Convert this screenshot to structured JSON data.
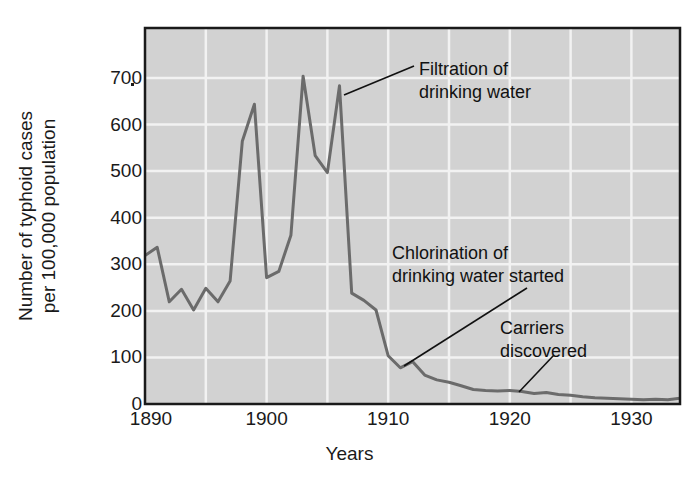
{
  "chart_data": {
    "type": "line",
    "title": "",
    "xlabel": "Years",
    "ylabel_line1": "Number of typhoid cases",
    "ylabel_line2": "per 100,000 population",
    "xlim": [
      1890,
      1934
    ],
    "ylim": [
      0,
      780
    ],
    "xticks": [
      1890,
      1900,
      1910,
      1920,
      1930
    ],
    "yticks": [
      0,
      100,
      200,
      300,
      400,
      500,
      600,
      700
    ],
    "grid": true,
    "legend": null,
    "series_name": "Typhoid fever case rate",
    "line_color": "#6b6b6b",
    "plot_background": "#d2d2d2",
    "gridline_color": "#f2f2f2",
    "x": [
      1890,
      1891,
      1892,
      1893,
      1894,
      1895,
      1896,
      1897,
      1898,
      1899,
      1900,
      1901,
      1902,
      1903,
      1904,
      1905,
      1906,
      1907,
      1908,
      1909,
      1910,
      1911,
      1912,
      1913,
      1914,
      1915,
      1916,
      1917,
      1918,
      1919,
      1920,
      1921,
      1922,
      1923,
      1924,
      1925,
      1926,
      1927,
      1928,
      1929,
      1930,
      1931,
      1932,
      1933,
      1934
    ],
    "values": [
      308,
      325,
      212,
      238,
      195,
      240,
      212,
      255,
      545,
      622,
      262,
      275,
      350,
      680,
      515,
      480,
      660,
      230,
      215,
      195,
      100,
      75,
      88,
      60,
      50,
      45,
      38,
      30,
      28,
      27,
      28,
      26,
      22,
      24,
      20,
      18,
      15,
      13,
      12,
      11,
      10,
      9,
      10,
      9,
      12
    ],
    "annotations": [
      {
        "id": "filtration",
        "text_line1": "Filtration of",
        "text_line2": "drinking water",
        "points_to_year": 1906,
        "points_to_value": 660
      },
      {
        "id": "chlorination",
        "text_line1": "Chlorination of",
        "text_line2": "drinking water started",
        "points_to_year": 1912,
        "points_to_value": 78
      },
      {
        "id": "carriers",
        "text_line1": "Carriers",
        "text_line2": "discovered",
        "points_to_year": 1921,
        "points_to_value": 26
      }
    ]
  }
}
